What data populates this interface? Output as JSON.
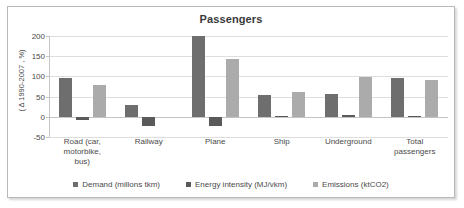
{
  "chart_data": {
    "type": "bar",
    "title": "Passengers",
    "xlabel": "",
    "ylabel": "( Δ 1990-2007 , %)",
    "ylim": [
      -50,
      200
    ],
    "yticks": [
      200,
      150,
      100,
      50,
      0,
      -50
    ],
    "ytick_labels": [
      "200",
      "150",
      "100",
      "50",
      "0",
      "-50"
    ],
    "grid": true,
    "legend_position": "bottom",
    "categories": [
      "Road (car, motorbike, bus)",
      "Railway",
      "Plane",
      "Ship",
      "Underground",
      "Total passengers"
    ],
    "category_lines": [
      [
        "Road (car,",
        "motorbike,",
        "bus)"
      ],
      [
        "Railway"
      ],
      [
        "Plane"
      ],
      [
        "Ship"
      ],
      [
        "Underground"
      ],
      [
        "Total",
        "passengers"
      ]
    ],
    "series": [
      {
        "name": "Demand (millons tkm)",
        "color": "#6e6e6e",
        "values": [
          95,
          30,
          200,
          55,
          57,
          97
        ]
      },
      {
        "name": "Energy intensity (MJ/vkm)",
        "color": "#5a5a5a",
        "values": [
          -7,
          -23,
          -23,
          2,
          5,
          2
        ]
      },
      {
        "name": "Emissions (ktCO2)",
        "color": "#ababab",
        "values": [
          79,
          0,
          143,
          61,
          98,
          92
        ]
      }
    ]
  },
  "colors": {
    "frame_border": "#b9b9b9",
    "gridline": "#dedede",
    "axis": "#c4c4c4",
    "text": "#4a4a4a",
    "title_text": "#3a3a3a",
    "background": "#ffffff"
  }
}
